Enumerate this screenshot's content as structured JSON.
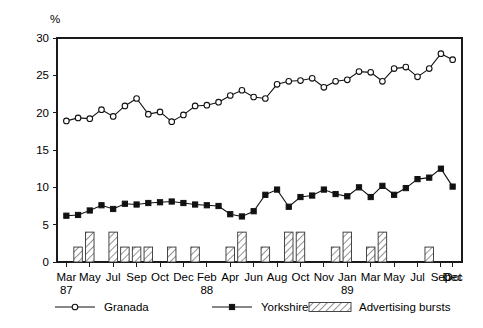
{
  "chart_data": {
    "type": "line",
    "title": "",
    "subtitle": "",
    "xlabel": "",
    "ylabel": "%",
    "ylim": [
      0,
      30
    ],
    "ytick_values": [
      0,
      5,
      10,
      15,
      20,
      25,
      30
    ],
    "ytick_labels": [
      "0",
      "5",
      "10",
      "15",
      "20",
      "25",
      "30"
    ],
    "grid": false,
    "legend_position": "bottom",
    "x_axis_note": "Monthly observations Mar 1987 through Dec 1989; only alternating months are tick-labelled",
    "categories": [
      "Mar",
      "Apr",
      "May",
      "Jun",
      "Jul",
      "Aug",
      "Sep",
      "Oct",
      "Nov",
      "Dec",
      "Jan",
      "Feb",
      "Mar",
      "Apr",
      "May",
      "Jun",
      "Jul",
      "Aug",
      "Sep",
      "Oct",
      "Nov",
      "Dec",
      "Jan",
      "Feb",
      "Mar",
      "Apr",
      "May",
      "Jun",
      "Jul",
      "Aug",
      "Sep",
      "Oct",
      "Nov",
      "Dec"
    ],
    "xtick_labels": [
      "Mar",
      "May",
      "Jul",
      "Sep",
      "Oct",
      "Dec",
      "Feb",
      "Apr",
      "Jun",
      "Aug",
      "Oct",
      "Nov",
      "Jan",
      "Mar",
      "May",
      "Jul",
      "Sep",
      "Oct",
      "Dec"
    ],
    "year_labels": [
      {
        "text": "87",
        "at_tick": 0
      },
      {
        "text": "88",
        "at_tick": 6
      },
      {
        "text": "89",
        "at_tick": 12
      }
    ],
    "series": [
      {
        "name": "Granada",
        "marker": "open-circle",
        "values": [
          18.9,
          19.3,
          19.2,
          20.4,
          19.5,
          20.9,
          21.9,
          19.8,
          20.1,
          18.8,
          19.7,
          20.9,
          21.0,
          21.4,
          22.3,
          23.0,
          22.1,
          21.9,
          23.8,
          24.2,
          24.3,
          24.6,
          23.4,
          24.2,
          24.4,
          25.5,
          25.4,
          24.2,
          25.9,
          26.1,
          24.8,
          25.9,
          27.9,
          27.1
        ]
      },
      {
        "name": "Yorkshire",
        "marker": "filled-square",
        "values": [
          6.2,
          6.3,
          6.9,
          7.6,
          7.1,
          7.8,
          7.7,
          7.9,
          8.0,
          8.1,
          7.9,
          7.7,
          7.6,
          7.5,
          6.4,
          6.1,
          6.8,
          9.0,
          9.7,
          7.4,
          8.7,
          8.9,
          9.7,
          9.1,
          8.8,
          10.0,
          8.7,
          10.2,
          9.0,
          9.9,
          11.1,
          11.3,
          12.5,
          10.1
        ]
      }
    ],
    "bars": {
      "name": "Advertising bursts",
      "pattern": "diagonal-hatch",
      "values": [
        0,
        2,
        4,
        0,
        4,
        2,
        2,
        2,
        0,
        2,
        0,
        2,
        0,
        0,
        2,
        4,
        0,
        2,
        0,
        4,
        4,
        0,
        0,
        2,
        4,
        0,
        2,
        4,
        0,
        0,
        0,
        2,
        0,
        0
      ]
    },
    "legend": [
      {
        "label": "Granada",
        "marker": "open-circle"
      },
      {
        "label": "Yorkshire",
        "marker": "filled-square"
      },
      {
        "label": "Advertising bursts",
        "marker": "hatched-bar"
      }
    ],
    "colors": {
      "line": "#111111",
      "marker_fill_open": "#ffffff",
      "marker_fill_solid": "#111111",
      "bar_stroke": "#333333",
      "axis": "#1a1a1a",
      "background": "#ffffff"
    }
  }
}
